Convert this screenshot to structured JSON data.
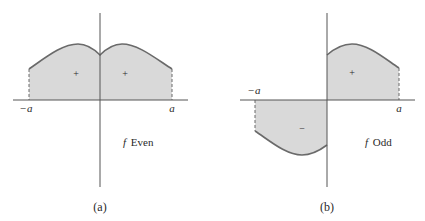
{
  "figure": {
    "colors": {
      "fill": "#d9d9d9",
      "curve": "#6a6a6a",
      "axis": "#555555",
      "text": "#2a2a2a"
    },
    "panels": [
      {
        "id": "a",
        "caption": "(a)",
        "function_label": "f Even",
        "function_symbol": "f",
        "function_kind": "Even",
        "x_labels": {
          "left": "−a",
          "right": "a"
        },
        "region_signs": [
          "+",
          "+"
        ]
      },
      {
        "id": "b",
        "caption": "(b)",
        "function_label": "f Odd",
        "function_symbol": "f",
        "function_kind": "Odd",
        "x_labels": {
          "left": "−a",
          "right": "a"
        },
        "region_signs": [
          "+",
          "−"
        ]
      }
    ]
  }
}
